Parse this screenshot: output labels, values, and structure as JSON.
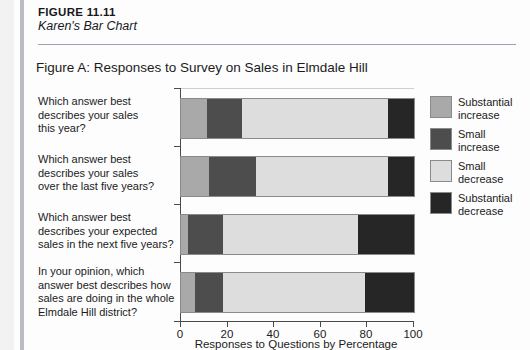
{
  "figure": {
    "number_prefix": "Figure",
    "number": "11.11",
    "number_full": "FIGURE 11.11",
    "title": "Karen's Bar Chart"
  },
  "chart_title": "Figure A: Responses to Survey on Sales in Elmdale Hill",
  "legend": {
    "items": [
      {
        "label": "Substantial increase",
        "line1": "Substantial",
        "line2": "increase",
        "color": "#a9a9a9"
      },
      {
        "label": "Small increase",
        "line1": "Small",
        "line2": "increase",
        "color": "#4d4d4d"
      },
      {
        "label": "Small decrease",
        "line1": "Small",
        "line2": "decrease",
        "color": "#dddddd"
      },
      {
        "label": "Substantial decrease",
        "line1": "Substantial",
        "line2": "decrease",
        "color": "#262626"
      }
    ]
  },
  "questions": [
    {
      "line1": "Which answer best",
      "line2": "describes your sales",
      "line3": "this year?",
      "line4": ""
    },
    {
      "line1": "Which answer best",
      "line2": "describes your sales",
      "line3": "over the last five years?",
      "line4": ""
    },
    {
      "line1": "Which answer best",
      "line2": "describes your expected",
      "line3": "sales in the next five years?",
      "line4": ""
    },
    {
      "line1": "In your opinion, which",
      "line2": "answer best describes how",
      "line3": "sales are doing in the whole",
      "line4": "Elmdale Hill district?"
    }
  ],
  "axis": {
    "x_title": "Responses to Questions by Percentage",
    "x_ticks": [
      "0",
      "20",
      "40",
      "60",
      "80",
      "100"
    ],
    "x_min": 0,
    "x_max": 100
  },
  "chart_data": {
    "type": "bar",
    "orientation": "horizontal",
    "stacked": true,
    "percent": true,
    "title": "Figure A: Responses to Survey on Sales in Elmdale Hill",
    "xlabel": "Responses to Questions by Percentage",
    "ylabel": "",
    "xlim": [
      0,
      100
    ],
    "grid": false,
    "legend_position": "right",
    "categories": [
      "Which answer best describes your sales this year?",
      "Which answer best describes your sales over the last five years?",
      "Which answer best describes your expected sales in the next five years?",
      "In your opinion, which answer best describes how sales are doing in the whole Elmdale Hill district?"
    ],
    "series": [
      {
        "name": "Substantial increase",
        "color": "#a9a9a9",
        "values": [
          11,
          12,
          3,
          6
        ]
      },
      {
        "name": "Small increase",
        "color": "#4d4d4d",
        "values": [
          15,
          20,
          15,
          12
        ]
      },
      {
        "name": "Small decrease",
        "color": "#dddddd",
        "values": [
          63,
          57,
          58,
          61
        ]
      },
      {
        "name": "Substantial decrease",
        "color": "#262626",
        "values": [
          11,
          11,
          24,
          21
        ]
      }
    ]
  }
}
